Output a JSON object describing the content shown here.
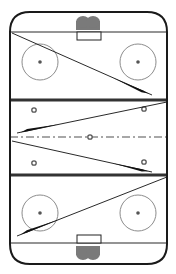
{
  "diagram": {
    "type": "hockey-rink-drill",
    "orientation": "vertical",
    "colors": {
      "background": "#ffffff",
      "boards": "#1a1a1a",
      "goal_line": "#2a2a2a",
      "blue_line": "#333333",
      "center_line": "#8a8a8a",
      "faceoff_circle": "#8c8c8c",
      "faceoff_dot": "#555555",
      "net": "#7a7a7a",
      "crease": "#222222",
      "pass_line": "#111111"
    },
    "rink": {
      "x": 10,
      "y": 12,
      "width": 157,
      "height": 252,
      "corner_radius": 20
    },
    "goal_lines": [
      {
        "name": "top-goal-line",
        "y": 32
      },
      {
        "name": "bottom-goal-line",
        "y": 243
      }
    ],
    "blue_lines": [
      {
        "name": "top-blue-line",
        "y": 100
      },
      {
        "name": "bottom-blue-line",
        "y": 175
      }
    ],
    "center_line": {
      "y": 137
    },
    "nets": [
      {
        "name": "top-net",
        "cx": 88,
        "y": 16
      },
      {
        "name": "bottom-net",
        "cx": 88,
        "y": 246
      }
    ],
    "creases": [
      {
        "name": "top-crease",
        "x": 77,
        "y": 32,
        "width": 24,
        "height": 8
      },
      {
        "name": "bottom-crease",
        "x": 77,
        "y": 235,
        "width": 24,
        "height": 8
      }
    ],
    "faceoff_circles": [
      {
        "name": "top-left-faceoff-circle",
        "cx": 40,
        "cy": 62,
        "r": 18
      },
      {
        "name": "top-right-faceoff-circle",
        "cx": 138,
        "cy": 62,
        "r": 18
      },
      {
        "name": "bottom-left-faceoff-circle",
        "cx": 40,
        "cy": 213,
        "r": 18
      },
      {
        "name": "bottom-right-faceoff-circle",
        "cx": 138,
        "cy": 213,
        "r": 18
      }
    ],
    "neutral_dots": [
      {
        "name": "neutral-dot-top-left",
        "cx": 34,
        "cy": 110
      },
      {
        "name": "neutral-dot-top-right",
        "cx": 144,
        "cy": 109
      },
      {
        "name": "center-faceoff-dot",
        "cx": 90,
        "cy": 137
      },
      {
        "name": "neutral-dot-bottom-left",
        "cx": 34,
        "cy": 163
      },
      {
        "name": "neutral-dot-bottom-right",
        "cx": 144,
        "cy": 162
      }
    ],
    "passes": [
      {
        "name": "pass-arrow-1",
        "x1": 12,
        "y1": 33,
        "x2": 152,
        "y2": 95,
        "wedge_start": 0.72
      },
      {
        "name": "pass-arrow-2",
        "x1": 167,
        "y1": 102,
        "x2": 17,
        "y2": 133,
        "wedge_start": 0.72
      },
      {
        "name": "pass-arrow-3",
        "x1": 12,
        "y1": 141,
        "x2": 152,
        "y2": 172,
        "wedge_start": 0.72
      },
      {
        "name": "pass-arrow-4",
        "x1": 167,
        "y1": 177,
        "x2": 17,
        "y2": 236,
        "wedge_start": 0.72
      }
    ]
  }
}
